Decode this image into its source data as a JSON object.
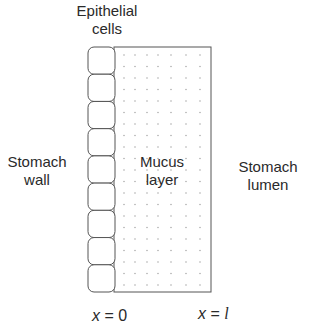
{
  "diagram": {
    "labels": {
      "epithelial_cells": [
        "Epithelial",
        "cells"
      ],
      "stomach_wall": [
        "Stomach",
        "wall"
      ],
      "mucus_layer": [
        "Mucus",
        "layer"
      ],
      "stomach_lumen": [
        "Stomach",
        "lumen"
      ]
    },
    "axis_marks": {
      "left": {
        "var": "x",
        "eq": " = ",
        "value": "0"
      },
      "right": {
        "var": "x",
        "eq": " = ",
        "value": "l"
      }
    },
    "epithelial_cell_count": 9,
    "colors": {
      "stroke": "#555555",
      "dots": "#9a9a9a",
      "text": "#2a2a2a"
    }
  }
}
